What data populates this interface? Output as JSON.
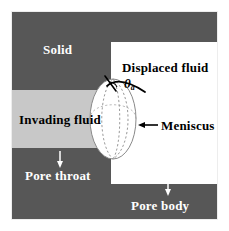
{
  "figure": {
    "width": 229,
    "height": 231,
    "background": "#ffffff"
  },
  "colors": {
    "solid": "#575757",
    "invading_fluid": "#c8c8c8",
    "displaced_fluid": "#ffffff",
    "meniscus_fill": "#ffffff",
    "meniscus_outline": "#8a8a8a",
    "meniscus_dashes": "#9a9a9a",
    "label_on_dark": "#ffffff",
    "label_on_light": "#000000",
    "annotation_line": "#000000",
    "frame": "#ededed"
  },
  "labels": {
    "solid": "Solid",
    "displaced_fluid": "Displaced fluid",
    "invading_fluid": "Invading fluid",
    "meniscus": "Meniscus",
    "pore_throat": "Pore throat",
    "pore_body": "Pore body",
    "contact_angle_symbol": "θ",
    "contact_angle_subscript": "a"
  },
  "regions": [
    {
      "name": "solid-top-left",
      "label": "Solid",
      "fill": "#575757",
      "role": "solid-grain"
    },
    {
      "name": "solid-top-strip",
      "label": "Solid",
      "fill": "#575757",
      "role": "solid-grain"
    },
    {
      "name": "invading-fluid-band",
      "label": "Invading fluid",
      "fill": "#c8c8c8",
      "role": "invading-fluid"
    },
    {
      "name": "solid-bottom-left",
      "label": "Pore throat",
      "fill": "#575757",
      "role": "solid-grain"
    },
    {
      "name": "solid-bottom-right",
      "label": "Pore body",
      "fill": "#575757",
      "role": "solid-grain"
    },
    {
      "name": "displaced-fluid-area",
      "label": "Displaced fluid",
      "fill": "#ffffff",
      "role": "displaced-fluid"
    }
  ],
  "annotations": {
    "contact_angle": {
      "symbol": "θ",
      "subscript": "a",
      "meaning": "advancing contact angle",
      "style": "italic-bold"
    },
    "meniscus_arrow": {
      "direction": "left",
      "points_to": "Meniscus"
    },
    "pore_throat_arrow": {
      "direction": "down",
      "color": "#ffffff"
    },
    "pore_body_arrow": {
      "direction": "down",
      "color": "#ffffff"
    }
  }
}
